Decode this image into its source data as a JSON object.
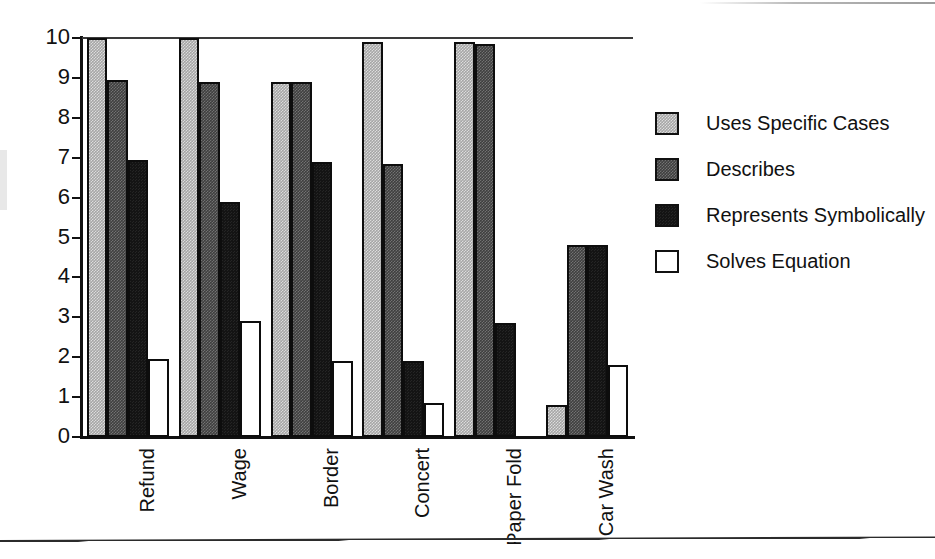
{
  "chart_data": {
    "type": "bar",
    "title": "",
    "subtitle": "",
    "xlabel": "",
    "ylabel": "",
    "ylim": [
      0,
      10
    ],
    "yticks": [
      0,
      1,
      2,
      3,
      4,
      5,
      6,
      7,
      8,
      9,
      10
    ],
    "ytick_labels": [
      "0",
      "1",
      "2",
      "3",
      "4",
      "5",
      "6",
      "7",
      "8",
      "9",
      "10"
    ],
    "grid": false,
    "top_gridline": true,
    "legend_position": "right",
    "categories": [
      "Refund",
      "Wage",
      "Border",
      "Concert",
      "Paper Fold",
      "Car Wash"
    ],
    "series": [
      {
        "name": "Uses Specific Cases",
        "color": "#a6a6a6",
        "values": [
          10,
          10,
          8.9,
          9.9,
          9.9,
          0.8
        ]
      },
      {
        "name": "Describes",
        "color": "#3f3f3f",
        "values": [
          8.95,
          8.9,
          8.9,
          6.85,
          9.85,
          4.8
        ]
      },
      {
        "name": "Represents Symbolically",
        "color": "#141414",
        "values": [
          6.95,
          5.9,
          6.9,
          1.9,
          2.85,
          4.8
        ]
      },
      {
        "name": "Solves Equation",
        "color": "#ffffff",
        "values": [
          1.95,
          2.9,
          1.9,
          0.85,
          0,
          1.8
        ]
      }
    ]
  },
  "legend": {
    "items": [
      {
        "label": "Uses Specific Cases",
        "swatch": "light-gray-swatch-icon"
      },
      {
        "label": "Describes",
        "swatch": "dark-gray-swatch-icon"
      },
      {
        "label": "Represents Symbolically",
        "swatch": "black-swatch-icon"
      },
      {
        "label": "Solves Equation",
        "swatch": "white-swatch-icon"
      }
    ]
  }
}
